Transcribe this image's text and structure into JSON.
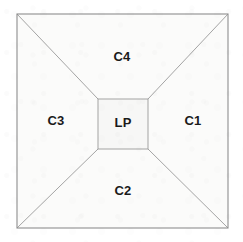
{
  "figure": {
    "kind": "geometric-partition-diagram",
    "background_color": "#ffffff"
  },
  "geometry": {
    "outer_square": {
      "x1": 17,
      "y1": 14,
      "x2": 228,
      "y2": 228
    },
    "core_rect": {
      "x1": 98,
      "y1": 99,
      "x2": 148,
      "y2": 149
    }
  },
  "style": {
    "fill_color": "#fbfbfa",
    "core_fill_color": "#f7f7f6",
    "line_color": "#9a9a9a",
    "frame_color": "#8e8e8e",
    "text_color": "#1a1a1a"
  },
  "labels": {
    "core": {
      "text": "LP",
      "x": 123,
      "y": 124
    },
    "regions": [
      {
        "id": "c1",
        "text": "C1",
        "x": 193,
        "y": 122,
        "position": "right"
      },
      {
        "id": "c2",
        "text": "C2",
        "x": 123,
        "y": 192,
        "position": "bottom"
      },
      {
        "id": "c3",
        "text": "C3",
        "x": 56,
        "y": 122,
        "position": "left"
      },
      {
        "id": "c4",
        "text": "C4",
        "x": 122,
        "y": 58,
        "position": "top"
      }
    ]
  }
}
